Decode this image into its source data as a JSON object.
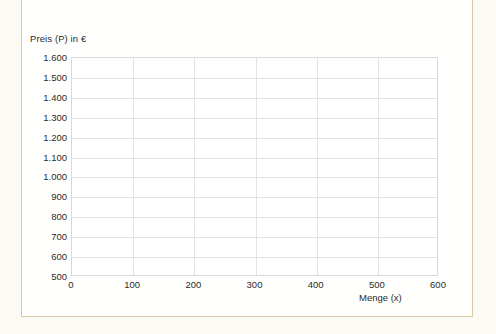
{
  "document": {
    "background_color": "#fbfaf5",
    "panel_background": "#fffffd",
    "border_color": "#d8c99e"
  },
  "chart_data": {
    "type": "line",
    "title": "",
    "subtitle": "",
    "xlabel": "Menge (x)",
    "ylabel": "Preis (P) in €",
    "xlim": [
      0,
      600
    ],
    "ylim": [
      500,
      1600
    ],
    "xticks": [
      0,
      100,
      200,
      300,
      400,
      500,
      600
    ],
    "yticks": [
      500,
      600,
      700,
      800,
      900,
      1000,
      1100,
      1200,
      1300,
      1400,
      1500,
      1600
    ],
    "xtick_labels": [
      "0",
      "100",
      "200",
      "300",
      "400",
      "500",
      "600"
    ],
    "ytick_labels": [
      "1.600",
      "1.500",
      "1.400",
      "1.300",
      "1.200",
      "1.100",
      "1.000",
      "900",
      "800",
      "700",
      "600",
      "500"
    ],
    "grid": true,
    "grid_color": "#e3e3e3",
    "legend": null,
    "series": [],
    "annotations": [],
    "note": "Empty coordinate grid — no data series plotted"
  },
  "colors": {
    "grid": "#e3e3e3",
    "axis": "#d9d9d9",
    "text": "#2a2a2a",
    "border": "#d8c99e",
    "plot_background": "#ffffff"
  }
}
